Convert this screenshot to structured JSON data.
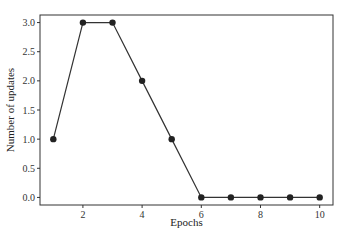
{
  "chart_data": {
    "type": "line",
    "title": "",
    "xlabel": "Epochs",
    "ylabel": "Number of updates",
    "x": [
      1,
      2,
      3,
      4,
      5,
      6,
      7,
      8,
      9,
      10
    ],
    "series": [
      {
        "name": "updates",
        "values": [
          1.0,
          3.0,
          3.0,
          2.0,
          1.0,
          0.0,
          0.0,
          0.0,
          0.0,
          0.0
        ],
        "color": "#333333",
        "marker": "circle"
      }
    ],
    "xticks": [
      2,
      4,
      6,
      8,
      10
    ],
    "xtick_labels": [
      "2",
      "4",
      "6",
      "8",
      "10"
    ],
    "yticks": [
      0.0,
      0.5,
      1.0,
      1.5,
      2.0,
      2.5,
      3.0
    ],
    "ytick_labels": [
      "0.0",
      "0.5",
      "1.0",
      "1.5",
      "2.0",
      "2.5",
      "3.0"
    ],
    "xlim": [
      0.55,
      10.45
    ],
    "ylim": [
      -0.13,
      3.13
    ],
    "grid": false,
    "legend": false
  }
}
